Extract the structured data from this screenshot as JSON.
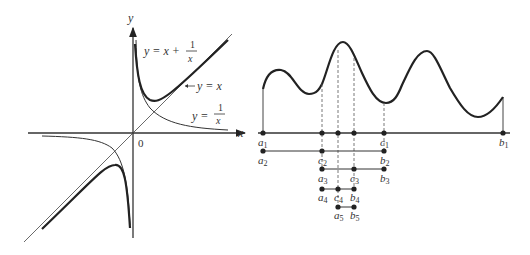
{
  "left_figure": {
    "axis_x_label": "x",
    "axis_y_label": "y",
    "origin_label": "0",
    "curve_main_label_lhs": "y = x + ",
    "curve_main_frac_num": "1",
    "curve_main_frac_den": "x",
    "asymptote_label": "y = x",
    "recip_label_lhs": "y = ",
    "recip_frac_num": "1",
    "recip_frac_den": "x"
  },
  "right_figure": {
    "axis_label": "x",
    "rows": [
      {
        "labels": [
          {
            "t": "a",
            "s": "1"
          },
          {
            "t": "c",
            "s": "1"
          },
          {
            "t": "b",
            "s": "1"
          }
        ]
      },
      {
        "labels": [
          {
            "t": "a",
            "s": "2"
          },
          {
            "t": "c",
            "s": "2"
          },
          {
            "t": "b",
            "s": "2"
          }
        ]
      },
      {
        "labels": [
          {
            "t": "a",
            "s": "3"
          },
          {
            "t": "c",
            "s": "3"
          },
          {
            "t": "b",
            "s": "3"
          }
        ]
      },
      {
        "labels": [
          {
            "t": "a",
            "s": "4"
          },
          {
            "t": "c",
            "s": "4"
          },
          {
            "t": "b",
            "s": "4"
          }
        ]
      },
      {
        "labels": [
          {
            "t": "a",
            "s": "5"
          },
          {
            "t": "b",
            "s": "5"
          }
        ]
      }
    ]
  }
}
